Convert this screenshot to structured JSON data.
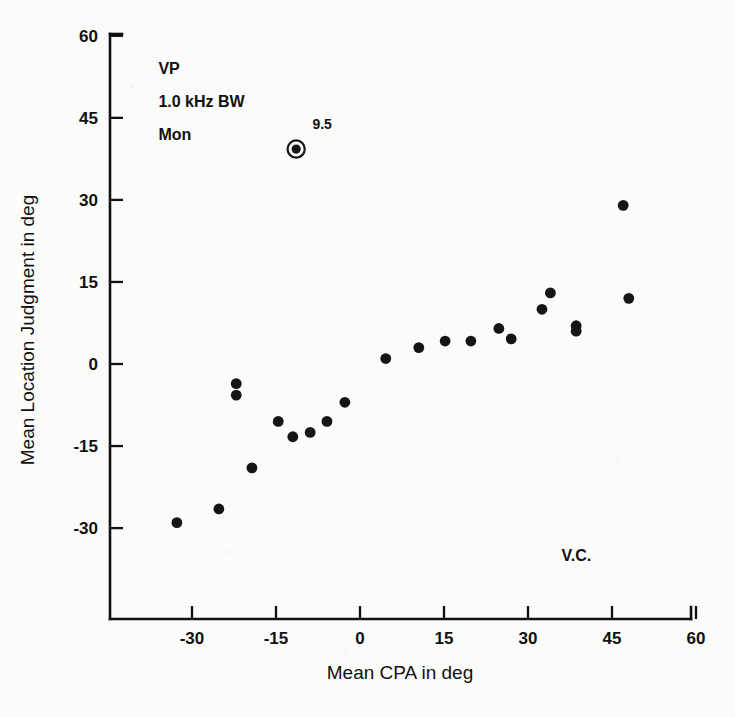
{
  "chart_data": {
    "type": "scatter",
    "title": "",
    "xlabel": "Mean CPA in deg",
    "ylabel": "Mean Location Judgment in deg",
    "xlim": [
      -40,
      60
    ],
    "ylim": [
      -40,
      60
    ],
    "xticks": [
      -30,
      -15,
      0,
      15,
      30,
      45,
      60
    ],
    "xticklabels": [
      "-30",
      "-15",
      "0",
      "15",
      "30",
      "45",
      "60"
    ],
    "yticks": [
      -30,
      -15,
      0,
      15,
      30,
      45,
      60
    ],
    "yticklabels": [
      "-30",
      "-15",
      "0",
      "15",
      "30",
      "45",
      "60"
    ],
    "grid": false,
    "legend": null,
    "marker": "filled-circle",
    "marker_color": "#151515",
    "points": [
      {
        "x": -32.7,
        "y": -29.0
      },
      {
        "x": -25.2,
        "y": -26.5
      },
      {
        "x": -22.1,
        "y": -3.6
      },
      {
        "x": -22.1,
        "y": -5.7
      },
      {
        "x": -19.3,
        "y": -19.0
      },
      {
        "x": -14.6,
        "y": -10.5
      },
      {
        "x": -12.0,
        "y": -13.3
      },
      {
        "x": -11.4,
        "y": 39.3,
        "highlight": true,
        "label": "9.5"
      },
      {
        "x": -8.9,
        "y": -12.5
      },
      {
        "x": -5.9,
        "y": -10.5
      },
      {
        "x": -2.7,
        "y": -7.0
      },
      {
        "x": 4.6,
        "y": 1.0
      },
      {
        "x": 10.5,
        "y": 3.0
      },
      {
        "x": 15.2,
        "y": 4.2
      },
      {
        "x": 19.8,
        "y": 4.2
      },
      {
        "x": 24.8,
        "y": 6.5
      },
      {
        "x": 27.0,
        "y": 4.6
      },
      {
        "x": 32.5,
        "y": 10.0
      },
      {
        "x": 34.0,
        "y": 13.0
      },
      {
        "x": 38.6,
        "y": 7.0
      },
      {
        "x": 38.6,
        "y": 6.0
      },
      {
        "x": 47.0,
        "y": 29.0
      },
      {
        "x": 48.0,
        "y": 12.0
      }
    ],
    "annotations": [
      {
        "name": "condition-vp",
        "text": "VP",
        "x": -36,
        "y": 53
      },
      {
        "name": "condition-bandwidth",
        "text": "1.0 kHz BW",
        "x": -36,
        "y": 47
      },
      {
        "name": "condition-mon",
        "text": "Mon",
        "x": -36,
        "y": 41
      },
      {
        "name": "point-value-label",
        "text": "9.5",
        "x": -8.5,
        "y": 43
      },
      {
        "name": "subject-initials",
        "text": "V.C.",
        "x": 36,
        "y": -36
      }
    ]
  }
}
